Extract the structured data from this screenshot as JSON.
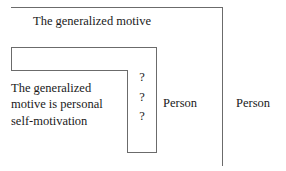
{
  "figure": {
    "labels": {
      "top_motive": "The generalized motive",
      "inner_statement": "The generalized\nmotive is personal\nself-motivation",
      "person_inner": "Person",
      "person_outer": "Person"
    },
    "question_marks": [
      "?",
      "?",
      "?"
    ],
    "colors": {
      "line": "#6b6b6b",
      "text": "#1a1a1a",
      "background": "#ffffff"
    }
  }
}
